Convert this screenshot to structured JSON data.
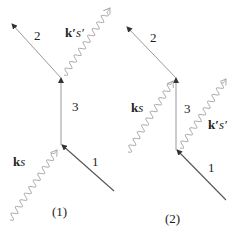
{
  "diagrams": [
    {
      "caption": "(1)",
      "lines": [
        {
          "label": "1",
          "type": "fermion",
          "x1": 114,
          "y1": 191,
          "x2": 62,
          "y2": 145
        },
        {
          "label": "3",
          "type": "fermion",
          "x1": 61,
          "y1": 145,
          "x2": 61,
          "y2": 78
        },
        {
          "label": "2",
          "type": "fermion",
          "x1": 61,
          "y1": 78,
          "x2": 12,
          "y2": 24
        }
      ],
      "photons": [
        {
          "label_bold": "k",
          "label_italic": "s",
          "prime": false,
          "x1": 10,
          "y1": 220,
          "x2": 57,
          "y2": 150
        },
        {
          "label_bold": "k′",
          "label_italic": "s′",
          "prime": true,
          "x1": 64,
          "y1": 75,
          "x2": 110,
          "y2": 8
        }
      ]
    },
    {
      "caption": "(2)",
      "lines": [
        {
          "label": "1",
          "type": "fermion",
          "x1": 226,
          "y1": 200,
          "x2": 177,
          "y2": 150
        },
        {
          "label": "3",
          "type": "fermion",
          "x1": 176,
          "y1": 150,
          "x2": 176,
          "y2": 78
        },
        {
          "label": "2",
          "type": "fermion",
          "x1": 176,
          "y1": 78,
          "x2": 127,
          "y2": 27
        }
      ],
      "photons": [
        {
          "label_bold": "k",
          "label_italic": "s",
          "prime": false,
          "x1": 128,
          "y1": 152,
          "x2": 173,
          "y2": 81
        },
        {
          "label_bold": "k′",
          "label_italic": "s′",
          "prime": true,
          "x1": 180,
          "y1": 148,
          "x2": 226,
          "y2": 79
        }
      ]
    }
  ],
  "labels": {
    "d1_line2": "2",
    "d1_line3": "3",
    "d1_line1": "1",
    "d1_photon_in_k": "k",
    "d1_photon_in_s": "s",
    "d1_photon_out_k": "k′",
    "d1_photon_out_s": "s′",
    "d1_caption": "(1)",
    "d2_line2": "2",
    "d2_line3": "3",
    "d2_line1": "1",
    "d2_photon_in_k": "k",
    "d2_photon_in_s": "s",
    "d2_photon_out_k": "k′",
    "d2_photon_out_s": "s′",
    "d2_caption": "(2)"
  },
  "colors": {
    "line": "#555555",
    "photon": "#aaaaaa",
    "text": "#222222"
  }
}
